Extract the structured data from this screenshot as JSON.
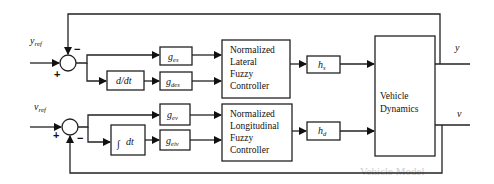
{
  "diagram": {
    "type": "control-block-diagram",
    "inputs": {
      "lateral_ref": "y",
      "lateral_ref_sub": "ref",
      "longitudinal_ref": "v",
      "longitudinal_ref_sub": "ref"
    },
    "summing_junctions": {
      "lateral": {
        "plus": "+",
        "minus": "−"
      },
      "longitudinal": {
        "plus": "+",
        "minus": "−"
      }
    },
    "blocks": {
      "derivative": "d/dt",
      "integral_symbol": "∫",
      "integral_text": "dt",
      "gain_es": {
        "base": "g",
        "sub": "es"
      },
      "gain_des": {
        "base": "g",
        "sub": "des"
      },
      "gain_ev": {
        "base": "g",
        "sub": "ev"
      },
      "gain_eiv": {
        "base": "g",
        "sub": "eiv"
      },
      "lateral_controller": [
        "Normalized",
        "Lateral",
        "Fuzzy",
        "Controller"
      ],
      "longitudinal_controller": [
        "Normalized",
        "Longitudinal",
        "Fuzzy",
        "Controller"
      ],
      "h_s": {
        "base": "h",
        "sub": "s"
      },
      "h_d": {
        "base": "h",
        "sub": "d"
      },
      "plant": [
        "Vehicle",
        "Dynamics"
      ]
    },
    "outputs": {
      "lateral": "y",
      "longitudinal": "v"
    },
    "background_text": {
      "heading": "Vehicle Model"
    }
  }
}
